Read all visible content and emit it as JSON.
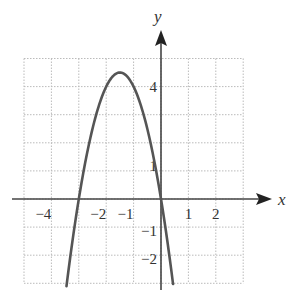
{
  "chart_data": {
    "type": "line",
    "title": "",
    "xlabel": "x",
    "ylabel": "y",
    "xlim": [
      -5,
      3
    ],
    "ylim": [
      -3,
      5
    ],
    "grid": true,
    "x_tick_labels": [
      "−4",
      "−2",
      "−1",
      "1",
      "2"
    ],
    "x_tick_values": [
      -4,
      -2,
      -1,
      1,
      2
    ],
    "y_tick_labels": [
      "4",
      "1",
      "−1",
      "−2"
    ],
    "y_tick_values": [
      4,
      1,
      -1,
      -2
    ],
    "series": [
      {
        "name": "parabola",
        "function": "-2x^2 - 6x",
        "vertex": [
          -1.5,
          4.5
        ],
        "roots": [
          -3,
          0
        ],
        "x": [
          -3.45,
          -3,
          -2.5,
          -2,
          -1.5,
          -1,
          -0.5,
          0,
          0.44
        ],
        "values": [
          -3.1,
          0,
          2.5,
          4,
          4.5,
          4,
          2.5,
          0,
          -3.0
        ]
      }
    ]
  },
  "axes": {
    "x_label": "x",
    "y_label": "y"
  },
  "colors": {
    "curve": "#555555",
    "axis": "#444444",
    "grid": "#bbbbbb"
  }
}
